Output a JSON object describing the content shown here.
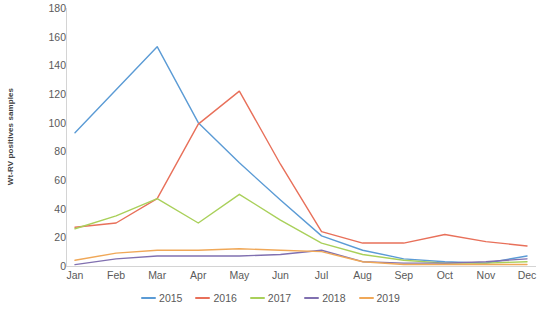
{
  "chart_data": {
    "type": "line",
    "title": "",
    "xlabel": "",
    "ylabel": "Wt-RV positives samples",
    "ylim": [
      0,
      180
    ],
    "yticks": [
      0,
      20,
      40,
      60,
      80,
      100,
      120,
      140,
      160,
      180
    ],
    "grid": false,
    "legend_position": "bottom",
    "categories": [
      "Jan",
      "Feb",
      "Mar",
      "Apr",
      "May",
      "Jun",
      "Jul",
      "Aug",
      "Sep",
      "Oct",
      "Nov",
      "Dec"
    ],
    "series": [
      {
        "name": "2015",
        "color": "#5B9BD5",
        "values": [
          93,
          123,
          153,
          100,
          72,
          46,
          21,
          11,
          5,
          3,
          2,
          7
        ]
      },
      {
        "name": "2016",
        "color": "#E8705A",
        "values": [
          27,
          30,
          47,
          99,
          122,
          71,
          24,
          16,
          16,
          22,
          17,
          14
        ]
      },
      {
        "name": "2017",
        "color": "#A9D05A",
        "values": [
          26,
          35,
          47,
          30,
          50,
          32,
          16,
          8,
          4,
          2,
          2,
          3
        ]
      },
      {
        "name": "2018",
        "color": "#8070B0",
        "values": [
          1,
          5,
          7,
          7,
          7,
          8,
          11,
          3,
          2,
          2,
          3,
          5
        ]
      },
      {
        "name": "2019",
        "color": "#F0A858",
        "values": [
          4,
          9,
          11,
          11,
          12,
          11,
          10,
          3,
          1,
          1,
          1,
          1
        ]
      }
    ]
  },
  "axis": {
    "y_title": "Wt-RV positives samples"
  }
}
